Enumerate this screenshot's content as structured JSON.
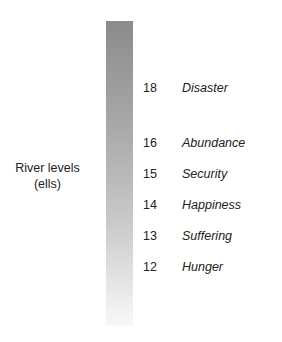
{
  "axis_label": {
    "line1": "River levels",
    "line2": "(ells)"
  },
  "levels": [
    {
      "value": "18",
      "meaning": "Disaster"
    },
    {
      "value": "16",
      "meaning": "Abundance"
    },
    {
      "value": "15",
      "meaning": "Security"
    },
    {
      "value": "14",
      "meaning": "Happiness"
    },
    {
      "value": "13",
      "meaning": "Suffering"
    },
    {
      "value": "12",
      "meaning": "Hunger"
    }
  ],
  "colors": {
    "bar_top": "#8b8b8b",
    "bar_bottom": "#f8f8f8",
    "text": "#222222"
  }
}
